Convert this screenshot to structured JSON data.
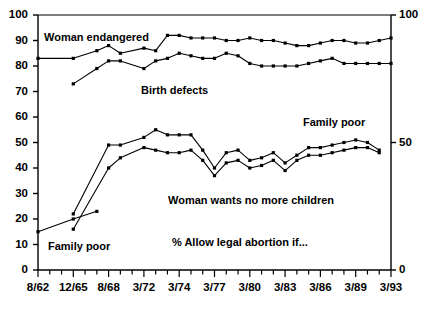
{
  "chart_data": {
    "type": "line",
    "title": "",
    "subtitle": "",
    "xlabel": "",
    "ylabel": "",
    "ylim": [
      0,
      100
    ],
    "y_ticks_left": [
      "100",
      "90",
      "80",
      "70",
      "60",
      "50",
      "40",
      "30",
      "20",
      "10",
      "0"
    ],
    "y_ticks_right": [
      "100",
      "50",
      "0"
    ],
    "y_tick_values_left": [
      100,
      90,
      80,
      70,
      60,
      50,
      40,
      30,
      20,
      10,
      0
    ],
    "y_tick_values_right": [
      100,
      50,
      0
    ],
    "x_tick_labels": [
      "8/62",
      "12/65",
      "8/68",
      "3/72",
      "3/74",
      "3/77",
      "3/80",
      "3/83",
      "3/86",
      "3/89",
      "3/93"
    ],
    "grid": false,
    "legend_position": "inline-annotations",
    "annotations": [
      {
        "text": "Woman endangered",
        "x": 44,
        "y": 31
      },
      {
        "text": "Birth defects",
        "x": 141,
        "y": 84
      },
      {
        "text": "Family poor",
        "x": 303,
        "y": 116
      },
      {
        "text": "Woman wants no more children",
        "x": 168,
        "y": 194
      },
      {
        "text": "% Allow legal abortion if...",
        "x": 172,
        "y": 236
      },
      {
        "text": "Family poor",
        "x": 48,
        "y": 240
      }
    ],
    "series": [
      {
        "name": "Woman endangered",
        "points": [
          [
            0,
            83
          ],
          [
            3,
            83
          ],
          [
            5,
            86
          ],
          [
            6,
            88
          ],
          [
            7,
            85
          ],
          [
            9,
            87
          ],
          [
            10,
            86
          ],
          [
            11,
            92
          ],
          [
            12,
            92
          ],
          [
            13,
            91
          ],
          [
            14,
            91
          ],
          [
            15,
            91
          ],
          [
            16,
            90
          ],
          [
            17,
            90
          ],
          [
            18,
            91
          ],
          [
            19,
            90
          ],
          [
            20,
            90
          ],
          [
            21,
            89
          ],
          [
            22,
            88
          ],
          [
            23,
            88
          ],
          [
            24,
            89
          ],
          [
            25,
            90
          ],
          [
            26,
            90
          ],
          [
            27,
            89
          ],
          [
            28,
            89
          ],
          [
            29,
            90
          ],
          [
            30,
            91
          ]
        ]
      },
      {
        "name": "Birth defects",
        "points": [
          [
            3,
            73
          ],
          [
            5,
            79
          ],
          [
            6,
            82
          ],
          [
            7,
            82
          ],
          [
            9,
            79
          ],
          [
            10,
            82
          ],
          [
            11,
            83
          ],
          [
            12,
            85
          ],
          [
            13,
            84
          ],
          [
            14,
            83
          ],
          [
            15,
            83
          ],
          [
            16,
            85
          ],
          [
            17,
            84
          ],
          [
            18,
            81
          ],
          [
            19,
            80
          ],
          [
            20,
            80
          ],
          [
            21,
            80
          ],
          [
            22,
            80
          ],
          [
            23,
            81
          ],
          [
            24,
            82
          ],
          [
            25,
            83
          ],
          [
            26,
            81
          ],
          [
            27,
            81
          ],
          [
            28,
            81
          ],
          [
            29,
            81
          ],
          [
            30,
            81
          ]
        ]
      },
      {
        "name": "Family poor",
        "points": [
          [
            3,
            22
          ],
          [
            6,
            49
          ],
          [
            7,
            49
          ],
          [
            9,
            52
          ],
          [
            10,
            55
          ],
          [
            11,
            53
          ],
          [
            12,
            53
          ],
          [
            13,
            53
          ],
          [
            14,
            47
          ],
          [
            15,
            40
          ],
          [
            16,
            46
          ],
          [
            17,
            47
          ],
          [
            18,
            43
          ],
          [
            19,
            44
          ],
          [
            20,
            46
          ],
          [
            21,
            42
          ],
          [
            22,
            45
          ],
          [
            23,
            48
          ],
          [
            24,
            48
          ],
          [
            25,
            49
          ],
          [
            26,
            50
          ],
          [
            27,
            51
          ],
          [
            28,
            50
          ],
          [
            29,
            47
          ]
        ]
      },
      {
        "name": "Woman wants no more children",
        "points": [
          [
            3,
            16
          ],
          [
            6,
            40
          ],
          [
            7,
            44
          ],
          [
            9,
            48
          ],
          [
            10,
            47
          ],
          [
            11,
            46
          ],
          [
            12,
            46
          ],
          [
            13,
            47
          ],
          [
            14,
            43
          ],
          [
            15,
            37
          ],
          [
            16,
            42
          ],
          [
            17,
            43
          ],
          [
            18,
            40
          ],
          [
            19,
            41
          ],
          [
            20,
            43
          ],
          [
            21,
            39
          ],
          [
            22,
            43
          ],
          [
            23,
            45
          ],
          [
            24,
            45
          ],
          [
            25,
            46
          ],
          [
            26,
            47
          ],
          [
            27,
            48
          ],
          [
            28,
            48
          ],
          [
            29,
            46
          ]
        ]
      },
      {
        "name": "Family poor early",
        "points": [
          [
            0,
            15
          ],
          [
            3,
            20
          ],
          [
            5,
            23
          ]
        ]
      }
    ]
  },
  "axes": {
    "left_axis_name": "left-value-axis",
    "right_axis_name": "right-value-axis",
    "bottom_axis_name": "date-axis"
  }
}
